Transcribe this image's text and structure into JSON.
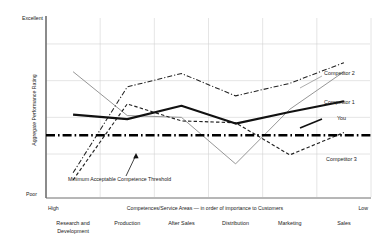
{
  "chart_data": {
    "type": "line",
    "title": "",
    "xlabel": "Competences/Service Areas — in order of importance to Customers",
    "ylabel": "Aggregate Performance Rating",
    "y_top_label": "Excellent",
    "y_bottom_label": "Poor",
    "x_left_label": "High",
    "x_right_label": "Low",
    "grid": true,
    "legend_position": "right-inline",
    "ylim": [
      0,
      10
    ],
    "categories": [
      "Research and Development",
      "Production",
      "After Sales",
      "Distribution",
      "Marketing",
      "Sales"
    ],
    "series": [
      {
        "name": "You",
        "style": "solid-thick",
        "color": "#111111",
        "values": [
          4.6,
          4.35,
          5.1,
          4.1,
          4.75,
          5.35
        ]
      },
      {
        "name": "Competitor 1",
        "style": "solid-thin",
        "color": "#8a8a8a",
        "values": [
          7.0,
          4.55,
          4.45,
          1.85,
          4.9,
          7.0
        ]
      },
      {
        "name": "Competitor 2",
        "style": "dash-dot",
        "color": "#222222",
        "values": [
          1.35,
          6.15,
          6.9,
          5.65,
          6.35,
          7.5
        ]
      },
      {
        "name": "Competitor 3",
        "style": "dashed",
        "color": "#222222",
        "values": [
          0.95,
          5.2,
          4.25,
          4.15,
          2.35,
          3.6
        ]
      }
    ],
    "threshold": {
      "label": "Minimum Acceptable Competence Threshold",
      "value": 3.45,
      "style": "dash-dot-bold",
      "color": "#000000"
    },
    "gridlines_y": [
      8.55,
      6.5,
      4.45,
      2.4
    ],
    "legend_labels": {
      "competitor_2": "Competitor 2",
      "competitor_1": "Competitor 1",
      "you": "You",
      "competitor_3": "Competitor 3"
    }
  }
}
